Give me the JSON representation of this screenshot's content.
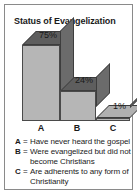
{
  "chart_title": "Status of Evangelization",
  "chart_data": {
    "type": "bar",
    "title": "Status of Evangelization",
    "xlabel": "",
    "ylabel": "",
    "ylim": [
      0,
      80
    ],
    "grid": false,
    "legend_position": "below",
    "categories": [
      "A",
      "B",
      "C"
    ],
    "values": [
      75,
      24,
      1
    ],
    "value_labels": [
      "75%",
      "24%",
      "1%"
    ],
    "category_descriptions": [
      "Have never heard the gospel",
      "Were evangelized but did not become Christians",
      "Are adherents to any form of Christianity"
    ],
    "style": "3d-bar",
    "colors": {
      "bar_front": "#b6b6b6",
      "bar_top": "#5e5e5e",
      "bar_side": "#6b6b6b",
      "text": "#1a1a1a",
      "border": "#8a8a8a"
    }
  },
  "axis": {
    "labels": [
      "A",
      "B",
      "C"
    ]
  },
  "legend": {
    "equals": "=",
    "rows": [
      {
        "key": "A",
        "text": "Have never heard the gospel"
      },
      {
        "key": "B",
        "text": "Were evangelized but did not"
      },
      {
        "key": "",
        "text": "become Christians"
      },
      {
        "key": "C",
        "text": "Are adherents to any form of"
      },
      {
        "key": "",
        "text": "Christianity"
      }
    ]
  }
}
